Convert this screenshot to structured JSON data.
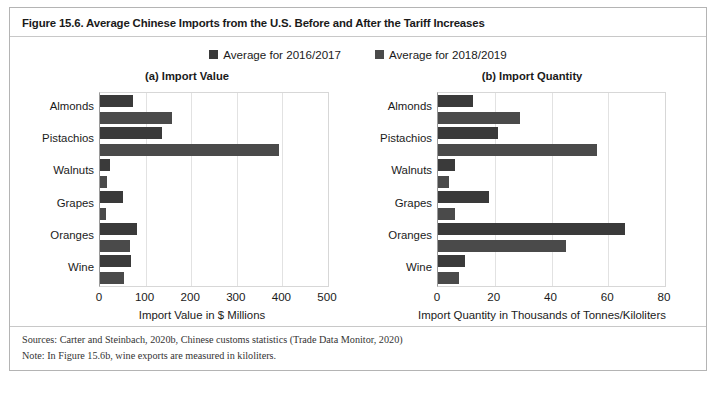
{
  "figure": {
    "title": "Figure 15.6. Average Chinese Imports from the U.S. Before and After the Tariff Increases",
    "sources": "Sources: Carter and Steinbach, 2020b, Chinese customs statistics (Trade Data Monitor, 2020)",
    "note": "Note: In Figure 15.6b, wine exports are measured in kiloliters."
  },
  "legend": {
    "items": [
      {
        "label": "Average for 2016/2017",
        "color": "#3a3a3a"
      },
      {
        "label": "Average for 2018/2019",
        "color": "#4a4a4a"
      }
    ]
  },
  "chart_data": [
    {
      "type": "bar",
      "orientation": "horizontal",
      "panel": "a",
      "title": "(a) Import Value",
      "xlabel": "Import Value in $ Millions",
      "ylabel": "",
      "xlim": [
        0,
        500
      ],
      "xticks": [
        0,
        100,
        200,
        300,
        400,
        500
      ],
      "xticklabels": [
        "0",
        "100",
        "200",
        "300",
        "400",
        "500"
      ],
      "grid": true,
      "legend_position": "top-center",
      "categories": [
        "Almonds",
        "Pistachios",
        "Walnuts",
        "Grapes",
        "Oranges",
        "Wine"
      ],
      "series": [
        {
          "name": "Average for 2016/2017",
          "color": "#3a3a3a",
          "values": [
            72,
            135,
            22,
            50,
            81,
            67
          ]
        },
        {
          "name": "Average for 2018/2019",
          "color": "#4a4a4a",
          "values": [
            157,
            392,
            15,
            13,
            66,
            52
          ]
        }
      ]
    },
    {
      "type": "bar",
      "orientation": "horizontal",
      "panel": "b",
      "title": "(b) Import Quantity",
      "xlabel": "Import Quantity in Thousands of Tonnes/Kiloliters",
      "ylabel": "",
      "xlim": [
        0,
        80
      ],
      "xticks": [
        0,
        20,
        40,
        60,
        80
      ],
      "xticklabels": [
        "0",
        "20",
        "40",
        "60",
        "80"
      ],
      "grid": true,
      "legend_position": "top-center",
      "categories": [
        "Almonds",
        "Pistachios",
        "Walnuts",
        "Grapes",
        "Oranges",
        "Wine"
      ],
      "series": [
        {
          "name": "Average for 2016/2017",
          "color": "#3a3a3a",
          "values": [
            12.5,
            21,
            6,
            18,
            66,
            9.5
          ]
        },
        {
          "name": "Average for 2018/2019",
          "color": "#4a4a4a",
          "values": [
            29,
            56,
            4,
            6,
            45,
            7.5
          ]
        }
      ]
    }
  ]
}
